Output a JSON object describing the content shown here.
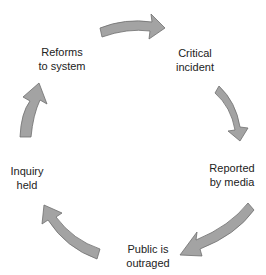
{
  "diagram": {
    "type": "cycle",
    "arrow_color": "#a3a3a3",
    "arrow_outline": "#6e6e6e",
    "text_color": "#222222",
    "nodes": [
      {
        "id": "critical-incident",
        "lines": [
          "Critical",
          "incident"
        ]
      },
      {
        "id": "reported-by-media",
        "lines": [
          "Reported",
          "by media"
        ]
      },
      {
        "id": "public-is-outraged",
        "lines": [
          "Public is",
          "outraged"
        ]
      },
      {
        "id": "inquiry-held",
        "lines": [
          "Inquiry",
          "held"
        ]
      },
      {
        "id": "reforms-to-system",
        "lines": [
          "Reforms",
          "to system"
        ]
      }
    ],
    "edges": [
      {
        "from": "reforms-to-system",
        "to": "critical-incident"
      },
      {
        "from": "critical-incident",
        "to": "reported-by-media"
      },
      {
        "from": "reported-by-media",
        "to": "public-is-outraged"
      },
      {
        "from": "public-is-outraged",
        "to": "inquiry-held"
      },
      {
        "from": "inquiry-held",
        "to": "reforms-to-system"
      }
    ]
  }
}
